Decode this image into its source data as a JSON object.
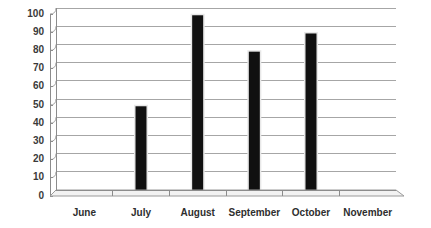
{
  "chart_data": {
    "type": "bar",
    "title": "",
    "subtitle": "",
    "xlabel": "",
    "ylabel": "",
    "categories": [
      "June",
      "July",
      "August",
      "September",
      "October",
      "November"
    ],
    "values": [
      0,
      46,
      96,
      76,
      86,
      0
    ],
    "series": [
      {
        "name": "",
        "values": [
          0,
          46,
          96,
          76,
          86,
          0
        ]
      }
    ],
    "ylim": [
      0,
      100
    ],
    "ytick_values": [
      0,
      10,
      20,
      30,
      40,
      50,
      60,
      70,
      80,
      90,
      100
    ],
    "ytick_labels": [
      "0",
      "10",
      "20",
      "30",
      "40",
      "50",
      "60",
      "70",
      "80",
      "90",
      "100"
    ],
    "grid": true,
    "grid_axis": "y",
    "legend": false,
    "legend_position": "none",
    "annotations": [],
    "bar_color": "#101010",
    "gridline_color": "#a6a6a6",
    "axis_color": "#8c8c8c",
    "label_color": "#2e2e2e",
    "background_color": "#ffffff",
    "style_note": "excel-3d-perspective"
  },
  "axis": {
    "y_labels": [
      "100",
      "90",
      "80",
      "70",
      "60",
      "50",
      "40",
      "30",
      "20",
      "10",
      "0"
    ],
    "x_labels": [
      "June",
      "July",
      "August",
      "September",
      "October",
      "November"
    ]
  },
  "bars": [
    {
      "category": "June",
      "value": 0,
      "visible": false
    },
    {
      "category": "July",
      "value": 46,
      "visible": true
    },
    {
      "category": "August",
      "value": 96,
      "visible": true
    },
    {
      "category": "September",
      "value": 76,
      "visible": true
    },
    {
      "category": "October",
      "value": 86,
      "visible": true
    },
    {
      "category": "November",
      "value": 0,
      "visible": false
    }
  ]
}
